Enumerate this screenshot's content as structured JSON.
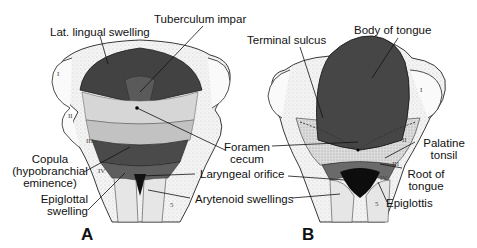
{
  "figure": {
    "panels": [
      {
        "id": "A",
        "label": "A",
        "labels": {
          "lat_lingual_swelling": "Lat. lingual swelling",
          "tuberculum_impar": "Tuberculum impar",
          "copula_line1": "Copula",
          "copula_line2": "(hypobranchial",
          "copula_line3": "eminence)",
          "epiglottal_line1": "Epiglottal",
          "epiglottal_line2": "swelling"
        },
        "arch_numerals": [
          "I",
          "II",
          "III",
          "IV",
          "5"
        ]
      },
      {
        "id": "B",
        "label": "B",
        "labels": {
          "terminal_sulcus": "Terminal sulcus",
          "body_of_tongue": "Body of tongue",
          "palatine_line1": "Palatine",
          "palatine_line2": "tonsil",
          "root_line1": "Root of",
          "root_line2": "tongue",
          "epiglottis": "Epiglottis"
        },
        "arch_numerals": [
          "I",
          "II",
          "III",
          "IV",
          "5"
        ]
      }
    ],
    "shared_labels": {
      "foramen_line1": "Foramen",
      "foramen_line2": "cecum",
      "laryngeal_orifice": "Laryngeal orifice",
      "arytenoid_swellings": "Arytenoid swellings"
    },
    "colors": {
      "dark_tissue": "#3f3f3f",
      "mid_tissue": "#7a7a7a",
      "light_tissue": "#d2d2d2",
      "outline": "#222222",
      "background": "#ffffff"
    }
  }
}
